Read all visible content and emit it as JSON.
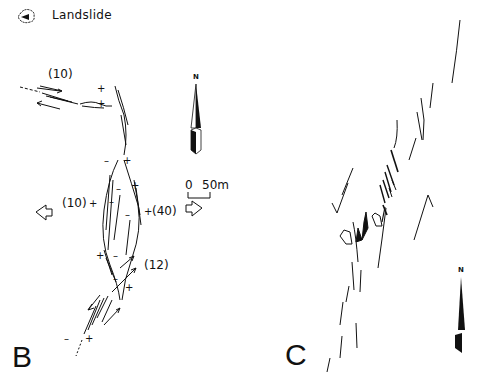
{
  "legend": {
    "icon": "landslide-symbol-icon",
    "label": "Landslide"
  },
  "panel_b": {
    "letter": "B",
    "annotations": [
      {
        "text": "(10)",
        "x": 50,
        "y": 70
      },
      {
        "text": "(10)",
        "x": 62,
        "y": 200
      },
      {
        "text": "(40)",
        "x": 152,
        "y": 208
      },
      {
        "text": "(12)",
        "x": 143,
        "y": 262
      }
    ],
    "plus_signs": [
      {
        "x": 100,
        "y": 90
      },
      {
        "x": 100,
        "y": 104
      },
      {
        "x": 124,
        "y": 160
      },
      {
        "x": 133,
        "y": 184
      },
      {
        "x": 92,
        "y": 202
      },
      {
        "x": 144,
        "y": 212
      },
      {
        "x": 99,
        "y": 255
      },
      {
        "x": 127,
        "y": 286
      },
      {
        "x": 86,
        "y": 339
      }
    ],
    "minus_signs": [
      {
        "x": 104,
        "y": 160
      },
      {
        "x": 118,
        "y": 187
      },
      {
        "x": 110,
        "y": 200
      },
      {
        "x": 126,
        "y": 213
      },
      {
        "x": 114,
        "y": 255
      },
      {
        "x": 115,
        "y": 278
      },
      {
        "x": 67,
        "y": 339
      }
    ],
    "scale_bar": {
      "start_label": "0",
      "end_label": "50m"
    },
    "north_label": "N"
  },
  "panel_c": {
    "letter": "C",
    "north_label": "N"
  }
}
